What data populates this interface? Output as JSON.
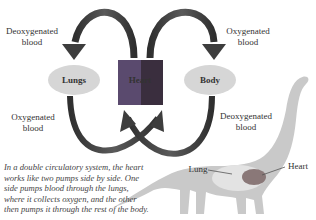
{
  "diagram": {
    "title": "Double circulatory system",
    "nodes": {
      "lungs": "Lungs",
      "heart": "Heart",
      "body": "Body"
    },
    "arrow_labels": {
      "top_left": [
        "Deoxygenated",
        "blood"
      ],
      "top_right": [
        "Oxygenated",
        "blood"
      ],
      "bottom_left": [
        "Oxygenated",
        "blood"
      ],
      "bottom_right": [
        "Deoxygenated",
        "blood"
      ]
    },
    "caption_lines": [
      "In a double circulatory system, the heart",
      "works like two pumps side by side. One",
      "side pumps blood through the lungs,",
      "where it collects oxygen, and the other",
      "then pumps it through the rest of the body."
    ],
    "dinosaur_labels": {
      "lung": "Lung",
      "heart": "Heart"
    },
    "colors": {
      "arrow": "#3d3d3d",
      "node_fill": "#d6d6d6",
      "heart_left": "#5a4a6e",
      "heart_right": "#3a2e3e",
      "dinosaur": "#c8c8c8",
      "dino_lung": "#e2e2e2",
      "dino_heart": "#8a7a7a"
    }
  }
}
